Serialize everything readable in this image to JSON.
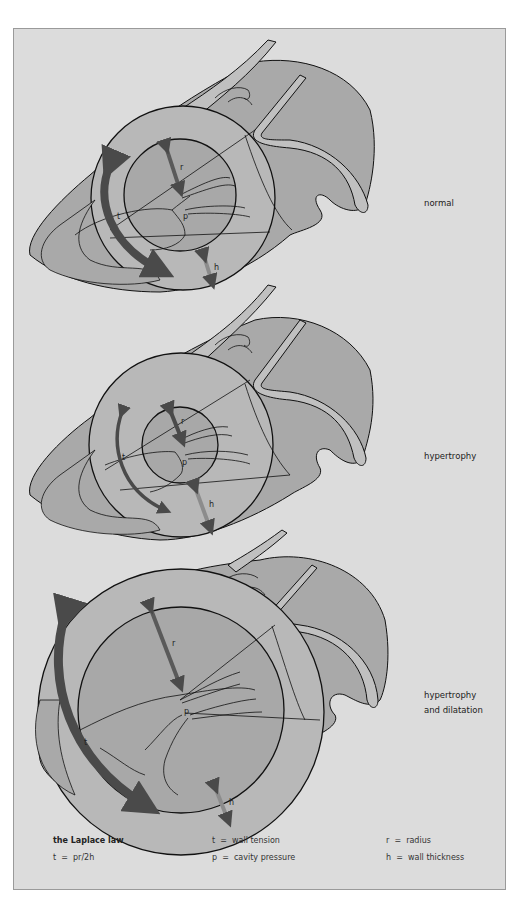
{
  "figure": {
    "colors": {
      "background": "#dcdcdc",
      "myocardium": "#a9a9a9",
      "cavity": "#b8b8b8",
      "light_region": "#c8c8c8",
      "outline": "#111111",
      "tension_arrow": "#4a4a4a",
      "radius_arrow": "#5a5a5a",
      "thickness_arrow": "#8c8c8c"
    },
    "panels": [
      {
        "id": "normal",
        "label": "normal",
        "symbols": {
          "r": "r",
          "t": "t",
          "p": "p",
          "h": "h"
        }
      },
      {
        "id": "hypertrophy",
        "label": "hypertrophy",
        "symbols": {
          "r": "r",
          "t": "t",
          "p": "p",
          "h": "h"
        }
      },
      {
        "id": "hypertrophy-dilatation",
        "label_line1": "hypertrophy",
        "label_line2": "and dilatation",
        "symbols": {
          "r": "r",
          "t": "t",
          "p": "p",
          "h": "h"
        }
      }
    ]
  },
  "legend": {
    "title": "the Laplace law",
    "formula": "t  =  pr/2h",
    "definitions": [
      {
        "symbol": "t",
        "text": "t  =  wall tension"
      },
      {
        "symbol": "p",
        "text": "p  =  cavity pressure"
      },
      {
        "symbol": "r",
        "text": "r  =  radius"
      },
      {
        "symbol": "h",
        "text": "h  =  wall thickness"
      }
    ]
  }
}
